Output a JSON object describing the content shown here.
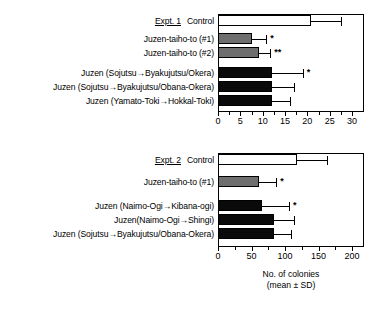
{
  "chart_data": [
    {
      "type": "bar",
      "orientation": "horizontal",
      "panel_label": "Expt. 1",
      "title": "",
      "xlabel": "",
      "ylabel": "",
      "xlim": [
        0,
        30
      ],
      "xticks": [
        0,
        5,
        10,
        15,
        20,
        25,
        30
      ],
      "xticklabels": [
        "0",
        "5",
        "10",
        "15",
        "20",
        "25",
        "30"
      ],
      "minor_ticks": true,
      "grid": false,
      "legend": false,
      "categories": [
        "Control",
        "Juzen-taiho-to (#1)",
        "Juzen-taiho-to (#2)",
        "Juzen (Sojutsu→Byakujutsu/Okera)",
        "Juzen (Sojutsu→Byakujutsu/Obana-Okera)",
        "Juzen (Yamato-Toki→Hokkal-Toki)"
      ],
      "values": [
        20.8,
        7.6,
        9.1,
        12.1,
        12.1,
        12.2
      ],
      "errors": [
        6.8,
        3.2,
        2.6,
        6.9,
        4.9,
        3.9
      ],
      "fills": [
        "white",
        "gray",
        "gray",
        "black",
        "black",
        "black"
      ],
      "annotations": [
        "",
        "*",
        "**",
        "*",
        "",
        ""
      ]
    },
    {
      "type": "bar",
      "orientation": "horizontal",
      "panel_label": "Expt. 2",
      "title": "",
      "xlabel": "No. of colonies\n(mean ± SD)",
      "ylabel": "",
      "xlim": [
        0,
        200
      ],
      "xticks": [
        0,
        50,
        100,
        150,
        200
      ],
      "xticklabels": [
        "0",
        "50",
        "100",
        "150",
        "200"
      ],
      "minor_ticks": true,
      "grid": false,
      "legend": false,
      "categories": [
        "Control",
        "Juzen-taiho-to (#1)",
        "Juzen (Naimo-Ogi→Kibana-ogi)",
        "Juzen(Naimo-Ogi→Shingi)",
        "Juzen (Sojutsu→Byakujutsu/Obana-Okera)"
      ],
      "values": [
        118,
        61,
        66,
        84,
        84
      ],
      "errors": [
        44,
        26,
        40,
        29,
        25
      ],
      "fills": [
        "white",
        "gray",
        "black",
        "black",
        "black"
      ],
      "annotations": [
        "",
        "*",
        "*",
        "",
        ""
      ]
    }
  ],
  "panel1": {
    "expt": "Expt. 1",
    "rows": [
      {
        "label": "Control",
        "value": 20.8,
        "error": 6.8,
        "fill": "white",
        "sig": ""
      },
      {
        "label": "Juzen-taiho-to (#1)",
        "value": 7.6,
        "error": 3.2,
        "fill": "gray",
        "sig": "*"
      },
      {
        "label": "Juzen-taiho-to (#2)",
        "value": 9.1,
        "error": 2.6,
        "fill": "gray",
        "sig": "**"
      },
      {
        "label": "Juzen (Sojutsu→Byakujutsu/Okera)",
        "value": 12.1,
        "error": 6.9,
        "fill": "black",
        "sig": "*"
      },
      {
        "label": "Juzen (Sojutsu→Byakujutsu/Obana-Okera)",
        "value": 12.1,
        "error": 4.9,
        "fill": "black",
        "sig": ""
      },
      {
        "label": "Juzen (Yamato-Toki→Hokkal-Toki)",
        "value": 12.2,
        "error": 3.9,
        "fill": "black",
        "sig": ""
      }
    ],
    "axis": {
      "max": 30,
      "ticks": [
        "0",
        "5",
        "10",
        "15",
        "20",
        "25",
        "30"
      ]
    }
  },
  "panel2": {
    "expt": "Expt. 2",
    "rows": [
      {
        "label": "Control",
        "value": 118,
        "error": 44,
        "fill": "white",
        "sig": ""
      },
      {
        "label": "Juzen-taiho-to (#1)",
        "value": 61,
        "error": 26,
        "fill": "gray",
        "sig": "*"
      },
      {
        "label": "Juzen (Naimo-Ogi→Kibana-ogi)",
        "value": 66,
        "error": 40,
        "fill": "black",
        "sig": "*"
      },
      {
        "label": "Juzen(Naimo-Ogi→Shingi)",
        "value": 84,
        "error": 29,
        "fill": "black",
        "sig": ""
      },
      {
        "label": "Juzen (Sojutsu→Byakujutsu/Obana-Okera)",
        "value": 84,
        "error": 25,
        "fill": "black",
        "sig": ""
      }
    ],
    "axis": {
      "max": 200,
      "ticks": [
        "0",
        "50",
        "100",
        "150",
        "200"
      ]
    },
    "axis_title_line1": "No. of colonies",
    "axis_title_line2": "(mean ± SD)"
  }
}
